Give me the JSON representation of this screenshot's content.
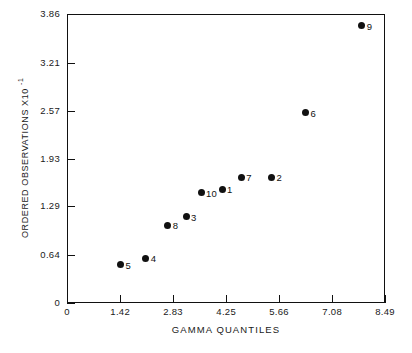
{
  "chart_data": {
    "type": "scatter",
    "title": "",
    "xlabel": "GAMMA QUANTILES",
    "ylabel": "ORDERED OBSERVATIONS X10",
    "ylabel_exponent": "-1",
    "xlim": [
      0,
      8.49
    ],
    "ylim": [
      0,
      3.86
    ],
    "grid": false,
    "legend": "none",
    "xticks": [
      "0",
      "1.42",
      "2.83",
      "4.25",
      "5.66",
      "7.08",
      "8.49"
    ],
    "xtick_values": [
      0,
      1.42,
      2.83,
      4.25,
      5.66,
      7.08,
      8.49
    ],
    "yticks": [
      "0",
      "0.64",
      "1.29",
      "1.93",
      "2.57",
      "3.21",
      "3.86"
    ],
    "ytick_values": [
      0,
      0.64,
      1.29,
      1.93,
      2.57,
      3.21,
      3.86
    ],
    "point_labels": [
      "5",
      "4",
      "8",
      "3",
      "10",
      "1",
      "7",
      "2",
      "6",
      "9"
    ],
    "x": [
      1.43,
      2.1,
      2.69,
      3.18,
      3.58,
      4.14,
      4.65,
      5.46,
      6.37,
      7.87
    ],
    "y": [
      0.51,
      0.6,
      1.04,
      1.15,
      1.47,
      1.52,
      1.68,
      1.68,
      2.54,
      3.7
    ],
    "points": [
      {
        "label": "5",
        "x": 1.43,
        "y": 0.51
      },
      {
        "label": "4",
        "x": 2.1,
        "y": 0.6
      },
      {
        "label": "8",
        "x": 2.69,
        "y": 1.04
      },
      {
        "label": "3",
        "x": 3.18,
        "y": 1.15
      },
      {
        "label": "10",
        "x": 3.58,
        "y": 1.47
      },
      {
        "label": "1",
        "x": 4.14,
        "y": 1.52
      },
      {
        "label": "7",
        "x": 4.65,
        "y": 1.68
      },
      {
        "label": "2",
        "x": 5.46,
        "y": 1.68
      },
      {
        "label": "6",
        "x": 6.37,
        "y": 2.54
      },
      {
        "label": "9",
        "x": 7.87,
        "y": 3.7
      }
    ],
    "marker": "filled-circle",
    "marker_color": "#111111",
    "axis_color": "#111111",
    "background_color": "#ffffff"
  }
}
